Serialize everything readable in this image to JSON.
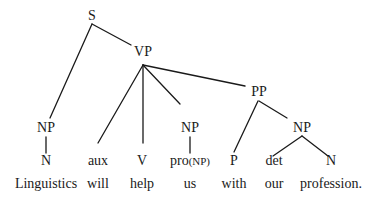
{
  "diagram": {
    "type": "syntax-tree",
    "nodes": {
      "s": {
        "label": "S",
        "x": 92,
        "y": 8
      },
      "vp": {
        "label": "VP",
        "x": 143,
        "y": 44
      },
      "pp": {
        "label": "PP",
        "x": 259,
        "y": 84
      },
      "np_subj": {
        "label": "NP",
        "x": 46,
        "y": 120
      },
      "np_obj": {
        "label": "NP",
        "x": 190,
        "y": 120
      },
      "np_pp": {
        "label": "NP",
        "x": 302,
        "y": 120
      }
    },
    "preterminals": [
      {
        "label": "N",
        "x": 46
      },
      {
        "label": "aux",
        "x": 98
      },
      {
        "label": "V",
        "x": 142
      },
      {
        "label": "pro",
        "suffix": "(NP)",
        "x": 190
      },
      {
        "label": "P",
        "x": 234
      },
      {
        "label": "det",
        "x": 274
      },
      {
        "label": "N",
        "x": 331
      }
    ],
    "words": [
      {
        "text": "Linguistics",
        "x": 46
      },
      {
        "text": "will",
        "x": 98
      },
      {
        "text": "help",
        "x": 142
      },
      {
        "text": "us",
        "x": 190
      },
      {
        "text": "with",
        "x": 234
      },
      {
        "text": "our",
        "x": 274
      },
      {
        "text": "profession.",
        "x": 331
      }
    ],
    "edges": [
      {
        "from": "S",
        "to": "VP",
        "x1": 92,
        "y1": 24,
        "x2": 131,
        "y2": 45
      },
      {
        "from": "S",
        "to": "NP",
        "x1": 92,
        "y1": 24,
        "x2": 50,
        "y2": 118
      },
      {
        "from": "VP",
        "to": "aux",
        "x1": 143,
        "y1": 65,
        "x2": 98,
        "y2": 143
      },
      {
        "from": "VP",
        "to": "V",
        "x1": 143,
        "y1": 65,
        "x2": 143,
        "y2": 143
      },
      {
        "from": "VP",
        "to": "NP",
        "x1": 143,
        "y1": 65,
        "x2": 180,
        "y2": 104
      },
      {
        "from": "VP",
        "to": "PP",
        "x1": 143,
        "y1": 65,
        "x2": 245,
        "y2": 86
      },
      {
        "from": "NP",
        "to": "N",
        "x1": 46,
        "y1": 137,
        "x2": 46,
        "y2": 153
      },
      {
        "from": "NP",
        "to": "pro(NP)",
        "x1": 190,
        "y1": 137,
        "x2": 190,
        "y2": 153
      },
      {
        "from": "PP",
        "to": "P",
        "x1": 258,
        "y1": 101,
        "x2": 234,
        "y2": 152
      },
      {
        "from": "PP",
        "to": "NP",
        "x1": 259,
        "y1": 101,
        "x2": 287,
        "y2": 118
      },
      {
        "from": "NP",
        "to": "det",
        "x1": 302,
        "y1": 136,
        "x2": 273,
        "y2": 156
      },
      {
        "from": "NP",
        "to": "N",
        "x1": 302,
        "y1": 136,
        "x2": 328,
        "y2": 156
      }
    ],
    "row_y": {
      "preterminal": 153,
      "word": 176
    },
    "colors": {
      "line": "#1a1a1a",
      "text": "#1a1a1a",
      "background": "#ffffff"
    }
  }
}
